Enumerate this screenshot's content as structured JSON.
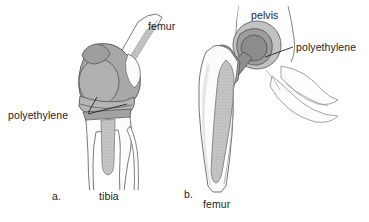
{
  "figure": {
    "type": "anatomical-illustration",
    "background_color": "#ffffff",
    "line_color": "#555555",
    "text_color": "#1c1c1c"
  },
  "colors": {
    "bone_fill": "#fbfbfb",
    "bone_outline": "#6b6b6b",
    "implant_light": "#c9c9c9",
    "implant_mid": "#a8a8a8",
    "implant_dark": "#8c8c8c",
    "stipple": "#b4b4b4",
    "leader_line": "#2b2b2b"
  },
  "panels": [
    {
      "id": "a",
      "letter": "a.",
      "subject": "knee-replacement",
      "labels": [
        {
          "name": "femur",
          "text": "femur"
        },
        {
          "name": "polyethylene",
          "text": "polyethylene"
        },
        {
          "name": "tibia",
          "text": "tibia"
        }
      ]
    },
    {
      "id": "b",
      "letter": "b.",
      "subject": "hip-replacement",
      "labels": [
        {
          "name": "pelvis",
          "text": "pelvis"
        },
        {
          "name": "polyethylene",
          "text": "polyethylene"
        },
        {
          "name": "femur",
          "text": "femur"
        }
      ]
    }
  ],
  "labels": {
    "femur_a": "femur",
    "polyethylene_a": "polyethylene",
    "panel_a": "a.",
    "tibia": "tibia",
    "pelvis": "pelvis",
    "polyethylene_b": "polyethylene",
    "panel_b": "b.",
    "femur_b": "femur"
  }
}
